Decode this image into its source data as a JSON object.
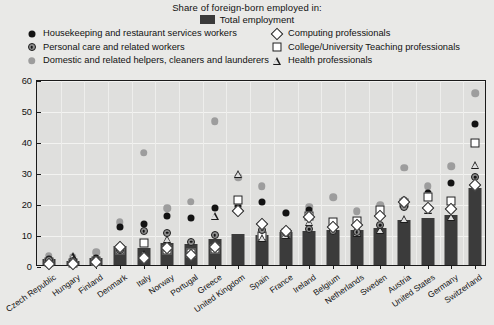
{
  "legend": {
    "title": "Share of foreign-born employed in:",
    "total": {
      "label": "Total employment",
      "icon": "bar-swatch",
      "color": "#3a3a3a"
    },
    "left_items": [
      {
        "label": "Housekeeping and restaurant services workers",
        "icon": "filled-circle-black-icon",
        "key": "housekeeping"
      },
      {
        "label": "Personal care and related workers",
        "icon": "bullseye-circle-icon",
        "key": "personal_care"
      },
      {
        "label": "Domestic and related helpers, cleaners and launderers",
        "icon": "filled-circle-gray-icon",
        "key": "domestic"
      }
    ],
    "right_items": [
      {
        "label": "Computing professionals",
        "icon": "open-diamond-icon",
        "key": "computing"
      },
      {
        "label": "College/University Teaching professionals",
        "icon": "open-square-icon",
        "key": "college"
      },
      {
        "label": "Health professionals",
        "icon": "open-triangle-icon",
        "key": "health"
      }
    ]
  },
  "chart_data": {
    "type": "scatter",
    "title": "Share of foreign-born employed in:",
    "xlabel": "",
    "ylabel": "",
    "ylim": [
      0,
      60
    ],
    "yticks": [
      0,
      10,
      20,
      30,
      40,
      50,
      60
    ],
    "grid": true,
    "legend_position": "top",
    "categories": [
      "Czech Republic",
      "Hungary",
      "Finland",
      "Denmark",
      "Italy",
      "Norway",
      "Portugal",
      "Greece",
      "United Kingdom",
      "Spain",
      "France",
      "Ireland",
      "Belgium",
      "Netherlands",
      "Sweden",
      "Austria",
      "United States",
      "Germany",
      "Switzerland"
    ],
    "series": [
      {
        "name": "Total employment",
        "key": "total",
        "type": "bar",
        "color": "#3b3b3b",
        "values": [
          2.0,
          1.2,
          2.2,
          6.0,
          5.4,
          7.0,
          6.7,
          8.5,
          10.0,
          9.8,
          10.6,
          11.0,
          11.2,
          11.3,
          12.0,
          14.5,
          15.3,
          16.0,
          24.8
        ]
      },
      {
        "name": "Housekeeping and restaurant services workers",
        "key": "housekeeping",
        "type": "point",
        "color": "#131313",
        "values": [
          2.6,
          2.2,
          3.0,
          13.0,
          14.0,
          16.5,
          15.8,
          19.0,
          19.6,
          21.0,
          17.3,
          18.5,
          14.0,
          14.5,
          18.0,
          21.5,
          24.0,
          27.0,
          46.0
        ]
      },
      {
        "name": "Personal care and related workers",
        "key": "personal_care",
        "type": "point",
        "color": "#8f8f8f",
        "values": [
          2.2,
          1.8,
          2.2,
          5.5,
          11.6,
          11.0,
          8.2,
          10.2,
          18.5,
          12.0,
          11.0,
          12.2,
          11.5,
          11.2,
          13.5,
          19.5,
          19.0,
          18.3,
          29.0
        ]
      },
      {
        "name": "Domestic and related helpers, cleaners and launderers",
        "key": "domestic",
        "type": "point",
        "color": "#9d9d9d",
        "values": [
          3.6,
          3.3,
          4.8,
          14.5,
          36.8,
          19.0,
          21.0,
          47.0,
          29.0,
          26.0,
          17.5,
          19.5,
          22.5,
          18.0,
          20.0,
          32.0,
          26.0,
          32.5,
          56.0
        ]
      },
      {
        "name": "Computing professionals",
        "key": "computing",
        "type": "point",
        "color": "#ffffff",
        "values": [
          1.0,
          1.0,
          1.6,
          6.5,
          3.0,
          6.2,
          4.0,
          6.4,
          18.0,
          14.0,
          11.5,
          16.0,
          12.8,
          13.5,
          16.3,
          21.0,
          19.0,
          18.6,
          26.5
        ]
      },
      {
        "name": "College/University Teaching professionals",
        "key": "college",
        "type": "point",
        "color": "#ffffff",
        "values": [
          1.5,
          1.2,
          2.0,
          5.6,
          7.6,
          5.5,
          4.6,
          5.8,
          21.5,
          10.0,
          11.0,
          16.5,
          14.5,
          15.0,
          18.5,
          20.8,
          22.5,
          21.2,
          40.0
        ]
      },
      {
        "name": "Health professionals",
        "key": "health",
        "type": "point",
        "color": "#1b1b1b",
        "values": [
          2.4,
          3.4,
          1.8,
          7.2,
          4.2,
          9.0,
          4.6,
          16.5,
          30.0,
          9.5,
          10.4,
          14.5,
          13.0,
          11.0,
          12.0,
          15.5,
          18.5,
          16.0,
          33.0
        ]
      }
    ]
  }
}
